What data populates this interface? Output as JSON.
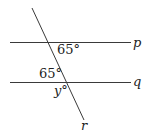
{
  "diagram": {
    "type": "parallel-lines-transversal",
    "lines": {
      "p": {
        "label": "p",
        "x1": 10,
        "y1": 42.5,
        "x2": 131,
        "y2": 42.5
      },
      "q": {
        "label": "q",
        "x1": 10,
        "y1": 82.5,
        "x2": 131,
        "y2": 82.5
      },
      "r": {
        "label": "r",
        "x1": 32,
        "y1": 8,
        "x2": 84,
        "y2": 120
      }
    },
    "angles": {
      "upper": {
        "text": "65°"
      },
      "lower": {
        "text": "65°"
      },
      "unknown": {
        "text": "y°"
      }
    },
    "colors": {
      "stroke": "#3a3a3a",
      "text": "#222222",
      "background": "#ffffff"
    }
  }
}
